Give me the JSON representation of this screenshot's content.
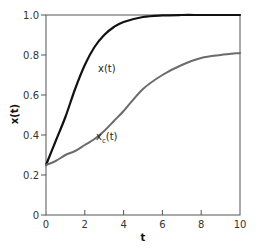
{
  "chart_data": {
    "type": "line",
    "title": "",
    "xlabel": "t",
    "ylabel": "x(t)",
    "xlim": [
      0,
      10
    ],
    "ylim": [
      0,
      1.0
    ],
    "xticks": [
      0,
      2,
      4,
      6,
      8,
      10
    ],
    "yticks": [
      0,
      0.2,
      0.4,
      0.6,
      0.8,
      1.0
    ],
    "xtick_labels": [
      "0",
      "2",
      "4",
      "6",
      "8",
      "10"
    ],
    "ytick_labels": [
      "0",
      "0.2",
      "0.4",
      "0.6",
      "0.8",
      "1.0"
    ],
    "grid": false,
    "legend": "none (inline labels)",
    "x": [
      0,
      0.5,
      1,
      1.5,
      2,
      2.5,
      3,
      3.5,
      4,
      5,
      6,
      7,
      8,
      9,
      10
    ],
    "series": [
      {
        "name": "x(t)",
        "label": "x(t)",
        "color": "#111111",
        "values": [
          0.25,
          0.37,
          0.49,
          0.63,
          0.75,
          0.84,
          0.9,
          0.94,
          0.965,
          0.99,
          0.998,
          1.0,
          1.0,
          1.0,
          1.0
        ]
      },
      {
        "name": "x_c(t)",
        "label_main": "x",
        "label_sub": "c",
        "label_tail": "(t)",
        "color": "#6b6b6b",
        "values": [
          0.25,
          0.27,
          0.3,
          0.32,
          0.35,
          0.38,
          0.42,
          0.47,
          0.52,
          0.63,
          0.7,
          0.75,
          0.785,
          0.8,
          0.81
        ]
      }
    ]
  }
}
